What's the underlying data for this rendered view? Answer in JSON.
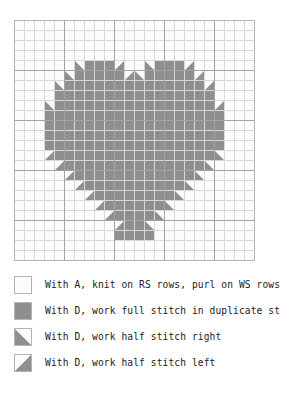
{
  "chart": {
    "columns": 24,
    "rows": 24,
    "cell_size": 10,
    "bold_line_every": 5,
    "colors": {
      "empty": "#fbfbfb",
      "filled": "#8f8f8f",
      "grid_light": "#d8d8d8",
      "grid_bold": "#a3a3a3",
      "border": "#b4b4b4"
    },
    "symbols": {
      "empty": ".",
      "full": "F",
      "half_right": "R",
      "half_left": "L"
    },
    "rows_data": [
      "........................",
      "........................",
      "........................",
      "........................",
      "......RFFFL..RFFFL......",
      ".....RFFFFFLRFFFFFL.....",
      "....RFFFFFFFFFFFFFFL....",
      "....FFFFFFFFFFFFFFFF....",
      "...RFFFFFFFFFFFFFFFFL...",
      "...FFFFFFFFFFFFFFFFFF...",
      "...FFFFFFFFFFFFFFFFFF...",
      "...FFFFFFFFFFFFFFFFFF...",
      "...FFFFFFFFFFFFFFFFFF...",
      "...LFFFFFFFFFFFFFFFFR...",
      "....LFFFFFFFFFFFFFFR....",
      ".....LFFFFFFFFFFFFR.....",
      "......LFFFFFFFFFFR......",
      ".......LFFFFFFFFR.......",
      "........LFFFFFFR........",
      ".........LFFFFR.........",
      "..........LFFR..........",
      "..........FFFF..........",
      "........................",
      "........................"
    ]
  },
  "legend": {
    "items": [
      {
        "swatch": "empty",
        "label": "With A, knit on RS rows, purl on WS rows"
      },
      {
        "swatch": "full",
        "label": "With D, work full stitch in duplicate st"
      },
      {
        "swatch": "half_right",
        "label": "With D, work half stitch right"
      },
      {
        "swatch": "half_left",
        "label": "With D, work half stitch left"
      }
    ]
  }
}
